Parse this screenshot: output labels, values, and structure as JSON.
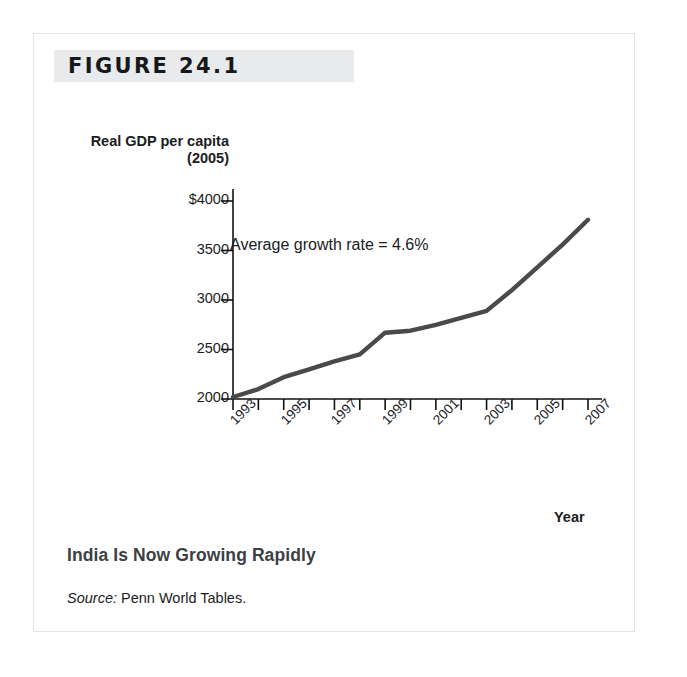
{
  "figure": {
    "header_label": "FIGURE 24.1",
    "caption_title": "India Is Now Growing Rapidly",
    "source_label": "Source:",
    "source_text": " Penn World Tables."
  },
  "chart_data": {
    "type": "line",
    "title": "India Is Now Growing Rapidly",
    "xlabel": "Year",
    "ylabel": "Real GDP per capita (2005)",
    "annotation": "Average growth rate = 4.6%",
    "xlim": [
      1993,
      2007.5
    ],
    "ylim": [
      1900,
      4050
    ],
    "grid": false,
    "legend": "none",
    "y_ticks": [
      {
        "value": 4000,
        "label": "$4000"
      },
      {
        "value": 3500,
        "label": "3500"
      },
      {
        "value": 3000,
        "label": "3000"
      },
      {
        "value": 2500,
        "label": "2500"
      },
      {
        "value": 2000,
        "label": "2000"
      }
    ],
    "x_tick_values": [
      1993,
      1994,
      1995,
      1996,
      1997,
      1998,
      1999,
      2000,
      2001,
      2002,
      2003,
      2004,
      2005,
      2006,
      2007
    ],
    "x_tick_labels": [
      {
        "value": 1993,
        "label": "1993"
      },
      {
        "value": 1995,
        "label": "1995"
      },
      {
        "value": 1997,
        "label": "1997"
      },
      {
        "value": 1999,
        "label": "1999"
      },
      {
        "value": 2001,
        "label": "2001"
      },
      {
        "value": 2003,
        "label": "2003"
      },
      {
        "value": 2005,
        "label": "2005"
      },
      {
        "value": 2007,
        "label": "2007"
      }
    ],
    "x": [
      1993,
      1994,
      1995,
      1996,
      1997,
      1998,
      1999,
      2000,
      2001,
      2002,
      2003,
      2004,
      2005,
      2006,
      2007
    ],
    "values": [
      2020,
      2100,
      2220,
      2300,
      2380,
      2450,
      2670,
      2690,
      2750,
      2820,
      2890,
      3100,
      3330,
      3560,
      3810
    ],
    "series": [
      {
        "name": "Real GDP per capita (2005)",
        "color": "#4a4a4a",
        "values": [
          2020,
          2100,
          2220,
          2300,
          2380,
          2450,
          2670,
          2690,
          2750,
          2820,
          2890,
          3100,
          3330,
          3560,
          3810
        ]
      }
    ]
  },
  "colors": {
    "line": "#4a4a4a",
    "axis": "#111111",
    "band": "#e8eaec",
    "border": "#e3e3e5",
    "caption": "#3d4043"
  }
}
